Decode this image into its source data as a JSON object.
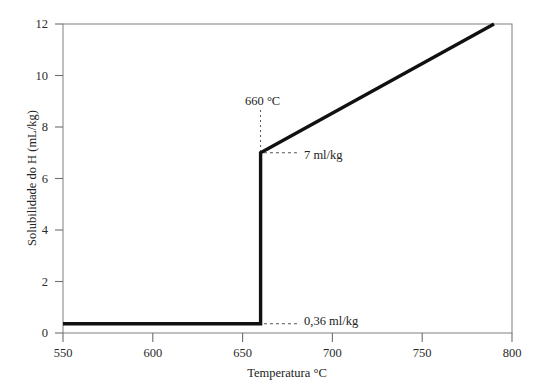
{
  "chart_data": {
    "type": "line",
    "title": "",
    "xlabel": "Temperatura °C",
    "ylabel": "Solubilidade do H (mL/kg)",
    "xlim": [
      550,
      800
    ],
    "ylim": [
      0,
      12
    ],
    "xticks": [
      550,
      600,
      650,
      700,
      750,
      800
    ],
    "yticks": [
      0,
      2,
      4,
      6,
      8,
      10,
      12
    ],
    "xtick_labels": [
      "550",
      "600",
      "650",
      "700",
      "750",
      "800"
    ],
    "ytick_labels": [
      "0",
      "2",
      "4",
      "6",
      "8",
      "10",
      "12"
    ],
    "grid": false,
    "legend": null,
    "series": [
      {
        "name": "Solubilidade do H no alumínio",
        "color": "#111111",
        "x": [
          550,
          660,
          660,
          790
        ],
        "values": [
          0.36,
          0.36,
          7,
          12
        ]
      }
    ],
    "annotations": [
      {
        "id": "melting-point",
        "label": "660 °C",
        "x": 660,
        "kind": "vertical-dotted-leader"
      },
      {
        "id": "liquid-solubility",
        "label": "7 ml/kg",
        "x": 660,
        "y": 7,
        "kind": "horizontal-dashed-leader"
      },
      {
        "id": "solid-solubility",
        "label": "0,36 ml/kg",
        "x": 660,
        "y": 0.36,
        "kind": "horizontal-dashed-leader"
      }
    ]
  },
  "axes": {
    "x_title": "Temperatura °C",
    "y_title": "Solubilidade do H (mL/kg)",
    "x_ticks": [
      "550",
      "600",
      "650",
      "700",
      "750",
      "800"
    ],
    "y_ticks": [
      "0",
      "2",
      "4",
      "6",
      "8",
      "10",
      "12"
    ]
  },
  "annotations": {
    "melting_point": "660 °C",
    "liquid_value": "7 ml/kg",
    "solid_value": "0,36 ml/kg"
  },
  "colors": {
    "background": "#ffffff",
    "frame": "#8a8a8a",
    "curve": "#111111",
    "text": "#222222",
    "leader": "#555555"
  }
}
